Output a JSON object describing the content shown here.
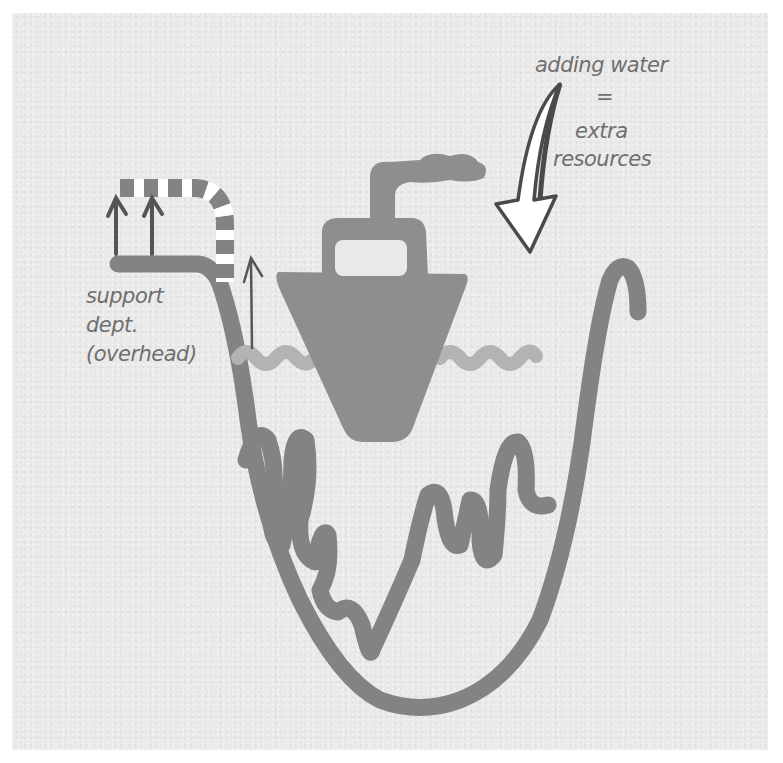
{
  "diagram": {
    "title": "",
    "labels": {
      "adding_water": "adding water",
      "equals": "=",
      "extra": "extra",
      "resources": "resources",
      "support": "support",
      "dept": "dept.",
      "overhead": "(overhead)"
    },
    "elements": [
      "bowl-outline",
      "boat",
      "boat-smoke",
      "water-line",
      "rocks-line",
      "support-pipe-striped",
      "support-ledge",
      "up-arrows",
      "adding-water-arrow"
    ],
    "colors": {
      "background": "#ffffff",
      "paper": "#e9e9e9",
      "stroke": "#808080",
      "boat": "#8e8e8e",
      "water": "#b3b3b3",
      "text": "#6f6f6f",
      "arrow_fill": "#ffffff",
      "arrow_stroke": "#4a4a4a"
    }
  }
}
